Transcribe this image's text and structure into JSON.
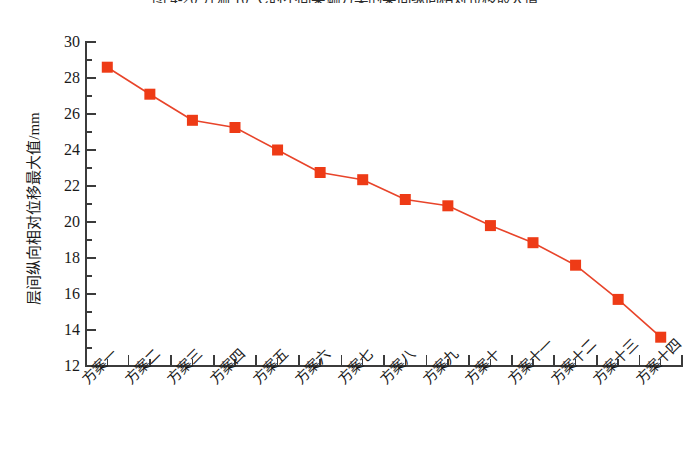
{
  "caption": {
    "text": "图 4-20   升温 10 ℃时不同梁端方案的梁间纵向相对位移最大值"
  },
  "chart_data": {
    "type": "line",
    "title": "",
    "xlabel": "",
    "ylabel": "层间纵向相对位移最大值/mm",
    "categories": [
      "方案一",
      "方案二",
      "方案三",
      "方案四",
      "方案五",
      "方案六",
      "方案七",
      "方案八",
      "方案九",
      "方案十",
      "方案十一",
      "方案十二",
      "方案十三",
      "方案十四"
    ],
    "values": [
      28.6,
      27.1,
      25.65,
      25.25,
      24.0,
      22.75,
      22.35,
      21.25,
      20.9,
      19.8,
      18.85,
      17.6,
      15.7,
      13.6
    ],
    "ylim": [
      12,
      30
    ],
    "ytick_labels": [
      "30",
      "28",
      "26",
      "24",
      "22",
      "20",
      "18",
      "16",
      "14",
      "12"
    ],
    "ytick_values": [
      30,
      28,
      26,
      24,
      22,
      20,
      18,
      16,
      14,
      12
    ],
    "ytick_step": 2,
    "yminor_step": 1,
    "grid": false,
    "legend": "none",
    "series_color": "#EE3B16",
    "marker": "square",
    "marker_color": "#EE3B16",
    "line_color": "#E8442A",
    "axis_color": "#3b3b3b"
  }
}
